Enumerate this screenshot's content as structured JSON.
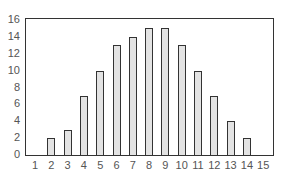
{
  "chart_data": {
    "type": "bar",
    "title": "",
    "xlabel": "",
    "ylabel": "",
    "categories": [
      "1",
      "2",
      "3",
      "4",
      "5",
      "6",
      "7",
      "8",
      "9",
      "10",
      "11",
      "12",
      "13",
      "14",
      "15"
    ],
    "values": [
      0,
      2,
      3,
      7,
      10,
      13,
      14,
      15,
      15,
      13,
      10,
      7,
      4,
      2,
      0
    ],
    "ylim": [
      0,
      16
    ],
    "yticks": [
      "0",
      "2",
      "4",
      "6",
      "8",
      "10",
      "12",
      "14",
      "16"
    ],
    "grid": false,
    "legend": null,
    "colors": {
      "bar_fill": "#e3e3e3",
      "bar_edge": "#333333",
      "frame": "#333333",
      "tick_text": "#555555"
    }
  }
}
